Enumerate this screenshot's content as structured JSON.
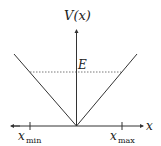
{
  "diagram": {
    "y_axis_label": "V(x)",
    "x_axis_label": "x",
    "energy_label": "E",
    "xmin_label": "x",
    "xmin_sub": "min",
    "xmax_label": "x",
    "xmax_sub": "max",
    "colors": {
      "line": "#333333",
      "dashed": "#555555"
    }
  }
}
